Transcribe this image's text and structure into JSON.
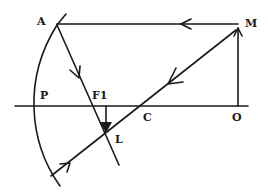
{
  "diagram": {
    "colors": {
      "ink": "#1a1a1a",
      "background": "#ffffff"
    },
    "labels": {
      "A": "A",
      "M": "M",
      "P": "P",
      "F1": "F1",
      "C": "C",
      "O": "O",
      "L": "L"
    },
    "elements": [
      {
        "id": "mirror",
        "type": "concave-mirror-arc"
      },
      {
        "id": "principal-axis",
        "type": "line",
        "from": "P",
        "to": "O"
      },
      {
        "id": "object",
        "type": "vertical-line",
        "from": "O",
        "to": "M"
      },
      {
        "id": "ray-parallel",
        "type": "ray",
        "from": "M",
        "to": "A",
        "direction": "left"
      },
      {
        "id": "ray-reflected-through-focus",
        "type": "ray",
        "from": "A",
        "through": [
          "F1",
          "L"
        ]
      },
      {
        "id": "ray-through-center",
        "type": "ray",
        "from": "M",
        "through": [
          "C",
          "L"
        ],
        "reflects_back": true
      },
      {
        "id": "image",
        "type": "inverted-arrow",
        "from": "F1",
        "to": "L"
      }
    ]
  }
}
